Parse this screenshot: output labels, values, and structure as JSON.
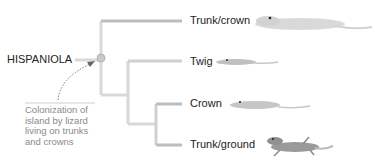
{
  "root": {
    "label": "HISPANIOLA"
  },
  "tips": [
    {
      "label": "Trunk/crown"
    },
    {
      "label": "Twig"
    },
    {
      "label": "Crown"
    },
    {
      "label": "Trunk/ground"
    }
  ],
  "annotation": {
    "lines": [
      "Colonization of",
      "island by lizard",
      "living on trunks",
      "and crowns"
    ]
  },
  "colors": {
    "branch": "#d8d8d8",
    "tip_branch": "#bdbdbd",
    "node": "#c8c8c8",
    "lizard_light": "#d6d6d6",
    "lizard_dark": "#9a9a9a"
  }
}
